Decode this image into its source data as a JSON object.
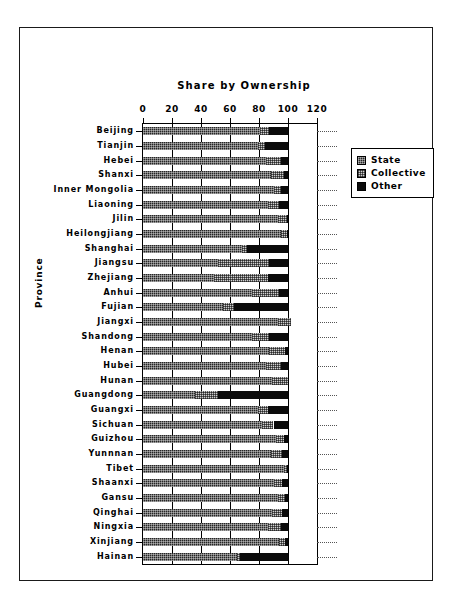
{
  "chart_data": {
    "type": "bar",
    "orientation": "horizontal",
    "stacked": true,
    "title": "Share by Ownership",
    "xlabel": "",
    "ylabel": "Province",
    "xlim": [
      0,
      120
    ],
    "xticks": [
      0,
      20,
      40,
      60,
      80,
      100,
      120
    ],
    "xtick_labels": [
      "0",
      "20",
      "40",
      "60",
      "80",
      "100",
      "120"
    ],
    "grid": true,
    "legend_position": "upper right",
    "legend": [
      {
        "name": "State",
        "pattern": "dark-crosshatch",
        "color": "#262626"
      },
      {
        "name": "Collective",
        "pattern": "light-crosshatch",
        "color": "#cfcfcf"
      },
      {
        "name": "Other",
        "pattern": "solid",
        "color": "#0b0b0b"
      }
    ],
    "categories": [
      "Beijing",
      "Tianjin",
      "Hebei",
      "Shanxi",
      "Inner Mongolia",
      "Liaoning",
      "Jilin",
      "Heilongjiang",
      "Shanghai",
      "Jiangsu",
      "Zhejiang",
      "Anhui",
      "Fujian",
      "Jiangxi",
      "Shandong",
      "Henan",
      "Hubei",
      "Hunan",
      "Guangdong",
      "Guangxi",
      "Sichuan",
      "Guizhou",
      "Yunnnan",
      "Tibet",
      "Shaanxi",
      "Gansu",
      "Qinghai",
      "Ningxia",
      "Xinjiang",
      "Hainan"
    ],
    "series": [
      {
        "name": "State",
        "values": [
          81,
          79,
          85,
          88,
          90,
          86,
          93,
          95,
          68,
          52,
          49,
          75,
          55,
          93,
          75,
          87,
          85,
          89,
          36,
          79,
          82,
          92,
          88,
          97,
          90,
          93,
          89,
          86,
          94,
          65
        ]
      },
      {
        "name": "Collective",
        "values": [
          6,
          5,
          10,
          9,
          5,
          8,
          6,
          4,
          4,
          35,
          37,
          19,
          8,
          9,
          12,
          11,
          10,
          11,
          16,
          7,
          8,
          5,
          8,
          2,
          6,
          5,
          7,
          9,
          4,
          2
        ]
      },
      {
        "name": "Other",
        "values": [
          13,
          16,
          5,
          3,
          5,
          6,
          1,
          1,
          28,
          13,
          14,
          6,
          37,
          0,
          13,
          2,
          5,
          0,
          48,
          14,
          10,
          3,
          4,
          1,
          4,
          2,
          4,
          5,
          2,
          33
        ]
      }
    ]
  }
}
